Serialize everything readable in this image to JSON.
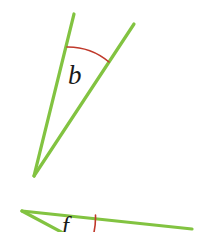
{
  "figure": {
    "width": 203,
    "height": 232,
    "background_color": "#ffffff",
    "ray_color": "#82c341",
    "arc_color": "#c0392b",
    "label_color": "#1a1a1a",
    "ray_stroke_width": 3.2,
    "arc_stroke_width": 1.6
  },
  "angles": [
    {
      "id": "angle-b",
      "label": "b",
      "label_position": {
        "x": 78,
        "y": 79
      },
      "vertex": {
        "x": 34,
        "y": 176
      },
      "rays": [
        {
          "name": "left-ray",
          "from": {
            "x": 34,
            "y": 176
          },
          "to": {
            "x": 74,
            "y": 14
          }
        },
        {
          "name": "right-ray",
          "from": {
            "x": 34,
            "y": 176
          },
          "to": {
            "x": 134,
            "y": 24
          }
        }
      ],
      "arc": {
        "start": {
          "x": 67,
          "y": 47
        },
        "end": {
          "x": 109,
          "y": 62
        },
        "radius": 62,
        "bow": "upward"
      }
    },
    {
      "id": "angle-f",
      "label": "f",
      "label_position": {
        "x": 70,
        "y": 228
      },
      "vertex": {
        "x": 22,
        "y": 211
      },
      "rays": [
        {
          "name": "upper-ray",
          "from": {
            "x": 22,
            "y": 211
          },
          "to": {
            "x": 192,
            "y": 229
          }
        },
        {
          "name": "lower-ray",
          "from": {
            "x": 22,
            "y": 211
          },
          "to": {
            "x": 78,
            "y": 240
          }
        }
      ],
      "arc": {
        "start": {
          "x": 95,
          "y": 215
        },
        "end": {
          "x": 93,
          "y": 238
        },
        "radius": 74,
        "bow": "rightward",
        "clipped": true
      }
    }
  ],
  "paths": {
    "b_left_ray": "M 34 176 L 74 14",
    "b_right_ray": "M 34 176 L 134 24",
    "b_arc": "M 67 47 A 64 64 0 0 1 109 62",
    "f_upper_ray": "M 22 211 L 192 229",
    "f_lower_ray": "M 22 211 L 80 242",
    "f_arc": "M 95.5 215 A 76 76 0 0 1 92 240"
  }
}
